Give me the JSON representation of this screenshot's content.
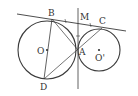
{
  "diagram": {
    "type": "geometry",
    "colors": {
      "stroke": "#3a3a3a",
      "text": "#333333",
      "background": "#ffffff"
    },
    "labels": {
      "B": "B",
      "M": "M",
      "C": "C",
      "O": "O",
      "A": "A",
      "O_prime": "O'",
      "D": "D"
    },
    "circles": [
      {
        "name": "O",
        "cx": 47,
        "cy": 50,
        "r": 29
      },
      {
        "name": "O'",
        "cx": 99,
        "cy": 50,
        "r": 21
      }
    ],
    "points": {
      "B": [
        52,
        19
      ],
      "M": [
        78,
        23
      ],
      "C": [
        102,
        28
      ],
      "A": [
        78,
        50
      ],
      "D": [
        44,
        79
      ],
      "O": [
        47,
        50
      ],
      "O_prime": [
        99,
        52
      ]
    },
    "segments": [
      [
        "tangent_line_start",
        "tangent_line_end"
      ],
      [
        "B",
        "D"
      ],
      [
        "B",
        "A"
      ],
      [
        "D",
        "C"
      ],
      [
        "vertical_top",
        "vertical_bottom"
      ]
    ],
    "equal_marks": [
      "BM",
      "MC",
      "MA"
    ]
  }
}
